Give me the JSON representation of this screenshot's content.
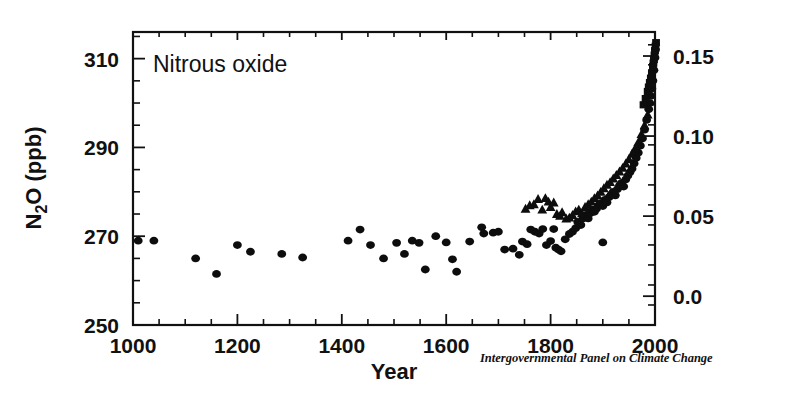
{
  "figure": {
    "panel_label": "Nitrous oxide",
    "credit": "Intergovernmental Panel on Climate Change",
    "background_color": "#ffffff",
    "ink_color": "#111111"
  },
  "axes": {
    "x_title": "Year",
    "y_left_title": "N2O (ppb)",
    "y_left_title_display": "N₂O (ppb)",
    "x_ticks": [
      "1000",
      "1200",
      "1400",
      "1600",
      "1800",
      "2000"
    ],
    "y_left_ticks": [
      "310",
      "290",
      "270",
      "250"
    ],
    "y_right_ticks": [
      "0.15",
      "0.10",
      "0.05",
      "0.0"
    ]
  },
  "chart_data": {
    "type": "scatter",
    "title": "Nitrous oxide",
    "xlabel": "Year",
    "ylabel": "N₂O (ppb)",
    "y2label": "Radiative forcing (W m-2)",
    "xlim": [
      1000,
      2000
    ],
    "ylim": [
      250,
      316
    ],
    "y2lim": [
      -0.018,
      0.165
    ],
    "grid": false,
    "legend": "none",
    "xticks": [
      1000,
      1200,
      1400,
      1600,
      1800,
      2000
    ],
    "yticks": [
      250,
      270,
      290,
      310
    ],
    "y2ticks": [
      0.0,
      0.05,
      0.1,
      0.15
    ],
    "xminor_step": 50,
    "yminor_step": 5,
    "y2minor_step": 0.0125,
    "series": [
      {
        "name": "Ice core (circles)",
        "marker": "circle",
        "points": [
          [
            1010,
            269.0
          ],
          [
            1040,
            269.0
          ],
          [
            1120,
            265.0
          ],
          [
            1160,
            261.5
          ],
          [
            1200,
            268.0
          ],
          [
            1225,
            266.5
          ],
          [
            1285,
            266.0
          ],
          [
            1325,
            265.2
          ],
          [
            1412,
            269.0
          ],
          [
            1435,
            271.5
          ],
          [
            1455,
            268.0
          ],
          [
            1480,
            265.0
          ],
          [
            1505,
            268.5
          ],
          [
            1520,
            266.0
          ],
          [
            1535,
            269.0
          ],
          [
            1548,
            268.5
          ],
          [
            1560,
            262.5
          ],
          [
            1580,
            270.0
          ],
          [
            1600,
            268.6
          ],
          [
            1612,
            264.8
          ],
          [
            1620,
            262.0
          ],
          [
            1645,
            268.8
          ],
          [
            1668,
            272.0
          ],
          [
            1672,
            270.6
          ],
          [
            1690,
            270.8
          ],
          [
            1700,
            271.0
          ],
          [
            1712,
            267.0
          ],
          [
            1728,
            267.2
          ],
          [
            1740,
            265.8
          ],
          [
            1746,
            268.8
          ],
          [
            1755,
            268.2
          ],
          [
            1762,
            271.5
          ],
          [
            1770,
            271.0
          ],
          [
            1778,
            270.6
          ],
          [
            1785,
            271.6
          ],
          [
            1792,
            268.0
          ],
          [
            1800,
            268.9
          ],
          [
            1806,
            271.6
          ],
          [
            1810,
            267.4
          ],
          [
            1815,
            267.0
          ],
          [
            1820,
            266.6
          ],
          [
            1828,
            269.3
          ],
          [
            1836,
            270.5
          ],
          [
            1842,
            271.0
          ],
          [
            1848,
            271.8
          ],
          [
            1852,
            273.2
          ],
          [
            1858,
            272.5
          ],
          [
            1862,
            274.0
          ],
          [
            1868,
            274.8
          ],
          [
            1872,
            274.0
          ],
          [
            1876,
            275.2
          ],
          [
            1880,
            276.0
          ],
          [
            1884,
            275.5
          ],
          [
            1888,
            276.2
          ],
          [
            1892,
            277.0
          ],
          [
            1896,
            277.4
          ],
          [
            1900,
            276.8
          ],
          [
            1904,
            278.2
          ],
          [
            1908,
            277.6
          ],
          [
            1912,
            278.8
          ],
          [
            1916,
            279.4
          ],
          [
            1920,
            280.0
          ],
          [
            1924,
            279.2
          ],
          [
            1928,
            280.6
          ],
          [
            1932,
            281.4
          ],
          [
            1936,
            282.0
          ],
          [
            1940,
            281.2
          ],
          [
            1944,
            282.8
          ],
          [
            1900,
            268.6
          ],
          [
            1948,
            283.6
          ],
          [
            1952,
            284.4
          ],
          [
            1956,
            285.2
          ],
          [
            1960,
            286.4
          ],
          [
            1964,
            287.6
          ],
          [
            1968,
            288.8
          ],
          [
            1972,
            290.4
          ],
          [
            1976,
            292.0
          ],
          [
            1980,
            294.0
          ],
          [
            1984,
            296.2
          ],
          [
            1988,
            298.6
          ],
          [
            1990,
            300.0
          ],
          [
            1992,
            301.6
          ],
          [
            1994,
            303.2
          ],
          [
            1996,
            305.0
          ],
          [
            1998,
            307.4
          ],
          [
            2000,
            310.2
          ],
          [
            2001,
            312.0
          ]
        ]
      },
      {
        "name": "Firn / atmospheric (triangles)",
        "marker": "triangle",
        "points": [
          [
            1752,
            276.2
          ],
          [
            1760,
            277.0
          ],
          [
            1768,
            277.2
          ],
          [
            1776,
            278.4
          ],
          [
            1784,
            276.0
          ],
          [
            1790,
            278.6
          ],
          [
            1796,
            277.8
          ],
          [
            1800,
            276.6
          ],
          [
            1806,
            277.6
          ],
          [
            1812,
            275.0
          ],
          [
            1818,
            274.6
          ],
          [
            1822,
            275.4
          ],
          [
            1830,
            274.0
          ],
          [
            1836,
            274.2
          ],
          [
            1842,
            274.8
          ],
          [
            1848,
            275.6
          ],
          [
            1854,
            276.0
          ],
          [
            1860,
            275.2
          ],
          [
            1866,
            276.6
          ],
          [
            1872,
            277.2
          ],
          [
            1878,
            277.8
          ],
          [
            1884,
            278.6
          ],
          [
            1890,
            279.2
          ],
          [
            1896,
            280.0
          ],
          [
            1902,
            280.8
          ],
          [
            1908,
            281.6
          ],
          [
            1914,
            282.2
          ],
          [
            1920,
            283.0
          ],
          [
            1926,
            283.8
          ],
          [
            1932,
            284.6
          ],
          [
            1938,
            285.4
          ],
          [
            1944,
            286.4
          ],
          [
            1950,
            287.4
          ],
          [
            1956,
            288.6
          ],
          [
            1962,
            289.8
          ],
          [
            1968,
            291.2
          ],
          [
            1974,
            293.0
          ],
          [
            1980,
            295.0
          ],
          [
            1986,
            297.4
          ]
        ]
      },
      {
        "name": "Modern direct (squares)",
        "marker": "square",
        "points": [
          [
            1978,
            299.6
          ],
          [
            1982,
            301.0
          ],
          [
            1986,
            302.6
          ],
          [
            1988,
            303.6
          ],
          [
            1990,
            304.6
          ],
          [
            1992,
            305.6
          ],
          [
            1994,
            306.8
          ],
          [
            1996,
            308.2
          ],
          [
            1997,
            309.0
          ],
          [
            1998,
            309.8
          ],
          [
            1999,
            310.8
          ],
          [
            2000,
            311.8
          ],
          [
            2001,
            312.8
          ],
          [
            2002,
            313.6
          ]
        ]
      }
    ]
  }
}
